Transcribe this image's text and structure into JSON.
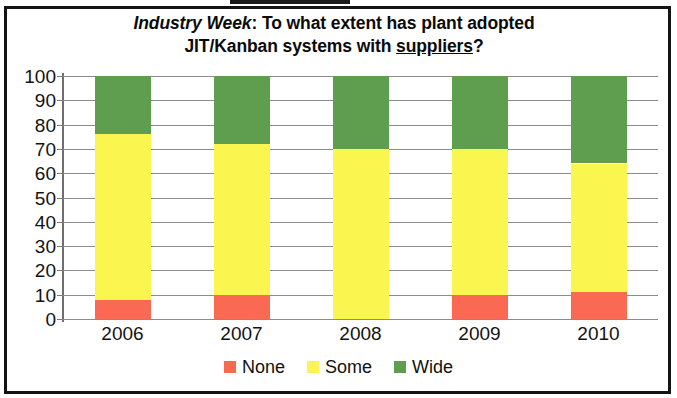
{
  "title": {
    "source": "Industry Week",
    "separator": ": ",
    "line1_rest": "To what extent has plant adopted",
    "line2_pre": "JIT/Kanban systems with ",
    "line2_emphasis": "suppliers",
    "line2_post": "?",
    "full": "Industry Week: To what extent has plant adopted JIT/Kanban systems with suppliers?"
  },
  "legend": {
    "items": [
      {
        "label": "None",
        "color": "#fa6a52"
      },
      {
        "label": "Some",
        "color": "#fbf64f"
      },
      {
        "label": "Wide",
        "color": "#5f9e4f"
      }
    ]
  },
  "axis": {
    "y_ticks": [
      100,
      90,
      80,
      70,
      60,
      50,
      40,
      30,
      20,
      10,
      0
    ],
    "x_ticks": [
      "2006",
      "2007",
      "2008",
      "2009",
      "2010"
    ]
  },
  "chart_data": {
    "type": "bar",
    "subtype": "stacked-column-100",
    "title": "Industry Week: To what extent has plant adopted JIT/Kanban systems with suppliers?",
    "xlabel": "",
    "ylabel": "",
    "ylim": [
      0,
      100
    ],
    "ytick_step": 10,
    "grid": true,
    "legend_position": "bottom",
    "categories": [
      "2006",
      "2007",
      "2008",
      "2009",
      "2010"
    ],
    "series": [
      {
        "name": "None",
        "color": "#fa6a52",
        "values": [
          8,
          10,
          0,
          10,
          11
        ]
      },
      {
        "name": "Some",
        "color": "#fbf64f",
        "values": [
          68,
          62,
          70,
          60,
          53
        ]
      },
      {
        "name": "Wide",
        "color": "#5f9e4f",
        "values": [
          24,
          28,
          30,
          30,
          36
        ]
      }
    ],
    "cumulative_tops": {
      "None": [
        8,
        10,
        0,
        10,
        11
      ],
      "Some": [
        76,
        72,
        70,
        70,
        64
      ],
      "Wide": [
        100,
        100,
        100,
        100,
        100
      ]
    }
  }
}
